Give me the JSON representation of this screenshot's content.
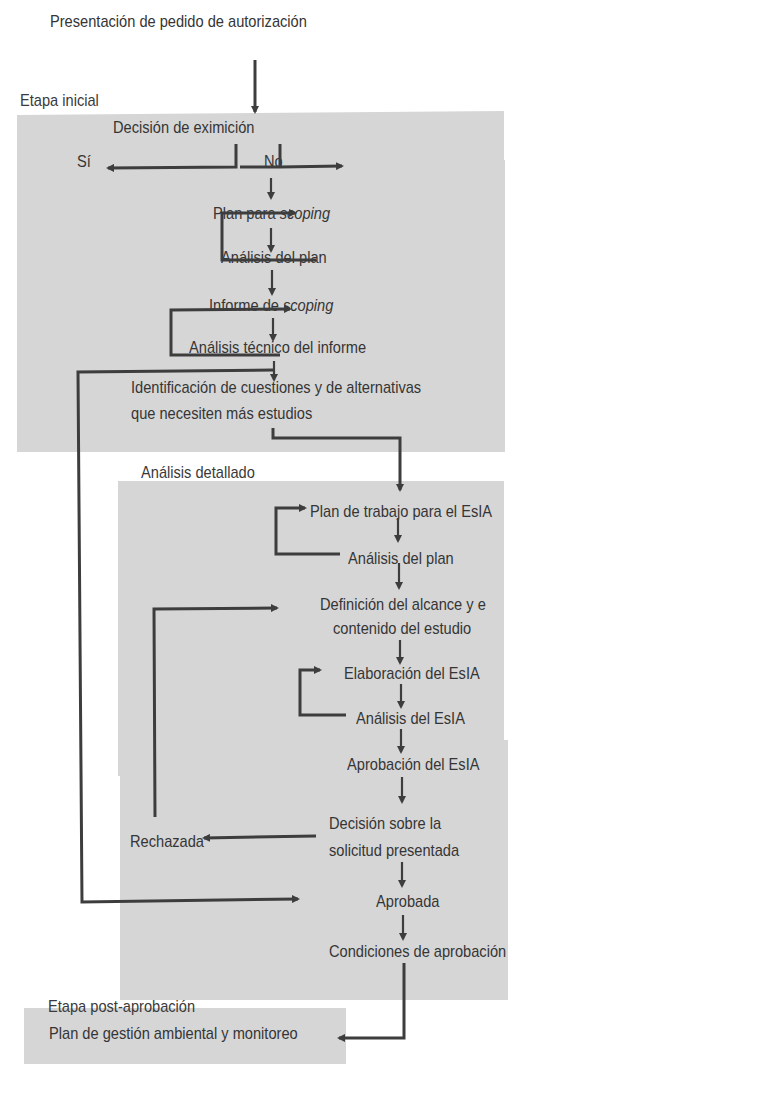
{
  "title": "Presentación de pedido de autorización",
  "stages": {
    "initial": {
      "label": "Etapa inicial",
      "nodes": {
        "exemption_decision": "Decisión de eximición",
        "yes": "Sí",
        "no": "No",
        "scoping_plan_prefix": "Plan para ",
        "scoping_plan_italic": "scoping",
        "plan_analysis": "Análisis del plan",
        "scoping_report_prefix": "Informe de ",
        "scoping_report_italic": "scoping",
        "report_technical_analysis": "Análisis técnico del informe",
        "issues_identification_line1": "Identificación de cuestiones y de alternativas",
        "issues_identification_line2": "que necesiten más estudios"
      }
    },
    "detailed": {
      "label": "Análisis detallado",
      "nodes": {
        "work_plan": "Plan de trabajo para el EsIA",
        "plan_analysis": "Análisis del plan",
        "scope_definition_line1": "Definición del alcance y e",
        "scope_definition_line2": "contenido del estudio",
        "eia_elaboration": "Elaboración del EsIA",
        "eia_analysis": "Análisis del EsIA",
        "eia_approval": "Aprobación del EsIA",
        "decision_line1": "Decisión sobre la",
        "decision_line2": "solicitud presentada",
        "rejected": "Rechazada",
        "approved": "Aprobada",
        "approval_conditions": "Condiciones de aprobación"
      }
    },
    "post_approval": {
      "label": "Etapa post-aprobación",
      "nodes": {
        "management_plan": "Plan de gestión ambiental y monitoreo"
      }
    }
  },
  "colors": {
    "panel": "#d6d6d6",
    "line": "#3d3d3d",
    "text": "#353535"
  }
}
